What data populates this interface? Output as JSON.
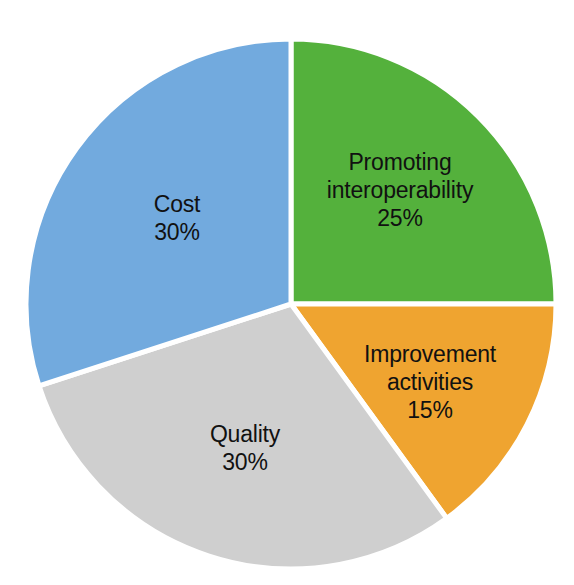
{
  "background_color": "#ffffff",
  "chart_data": {
    "type": "pie",
    "title": "",
    "subtitle": "",
    "xlabel": "",
    "ylabel": "",
    "legend_position": "none",
    "grid": false,
    "label_text_color": "#111111",
    "separator_color": "#ffffff",
    "start_angle_deg": 0,
    "direction": "clockwise",
    "center": {
      "x": 291,
      "y": 304
    },
    "radius": 265,
    "categories": [
      "Promoting interoperability",
      "Improvement activities",
      "Quality",
      "Cost"
    ],
    "values": [
      25,
      15,
      30,
      30
    ],
    "value_suffix": "%",
    "colors": [
      "#54b13c",
      "#efa430",
      "#cfcfcf",
      "#72aade"
    ],
    "slices": [
      {
        "name": "Promoting interoperability",
        "label_line1": "Promoting",
        "label_line2": "interoperability",
        "value": 25,
        "value_label": "25%",
        "color": "#54b13c",
        "start_deg": 0,
        "end_deg": 90,
        "label_x": 400,
        "label_y": 190
      },
      {
        "name": "Improvement activities",
        "label_line1": "Improvement",
        "label_line2": "activities",
        "value": 15,
        "value_label": "15%",
        "color": "#efa430",
        "start_deg": 90,
        "end_deg": 144,
        "label_x": 430,
        "label_y": 382
      },
      {
        "name": "Quality",
        "label_line1": "Quality",
        "label_line2": "",
        "value": 30,
        "value_label": "30%",
        "color": "#cfcfcf",
        "start_deg": 144,
        "end_deg": 252,
        "label_x": 245,
        "label_y": 448
      },
      {
        "name": "Cost",
        "label_line1": "Cost",
        "label_line2": "",
        "value": 30,
        "value_label": "30%",
        "color": "#72aade",
        "start_deg": 252,
        "end_deg": 360,
        "label_x": 177,
        "label_y": 218
      }
    ]
  }
}
